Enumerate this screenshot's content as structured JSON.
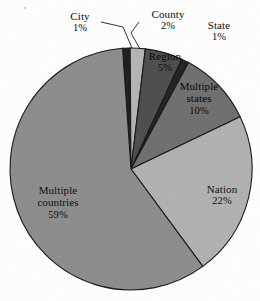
{
  "chart_data": {
    "type": "pie",
    "title": "",
    "subtitle": "",
    "xlabel": "",
    "ylabel": "",
    "grid": false,
    "legend_position": "none",
    "label_format": "name + percent",
    "total_percent": 100,
    "start_angle_deg": 356,
    "direction": "clockwise",
    "center_px": {
      "x": 131,
      "y": 169
    },
    "radius_px": 121,
    "categories": [
      "City",
      "County",
      "Region",
      "State",
      "Multiple states",
      "Nation",
      "Multiple countries"
    ],
    "values": [
      1,
      2,
      5,
      1,
      10,
      22,
      59
    ],
    "slices": [
      {
        "label": "City",
        "percent_text": "1%",
        "value": 1,
        "color": "#1b1b1b",
        "label_placement": "outside",
        "leader_line": true
      },
      {
        "label": "County",
        "percent_text": "2%",
        "value": 2,
        "color": "#b4b4b4",
        "label_placement": "outside",
        "leader_line": true
      },
      {
        "label": "Region",
        "percent_text": "5%",
        "value": 5,
        "color": "#4b4b4b",
        "label_placement": "inside",
        "leader_line": false
      },
      {
        "label": "State",
        "percent_text": "1%",
        "value": 1,
        "color": "#1f1f1f",
        "label_placement": "outside",
        "leader_line": false
      },
      {
        "label": "Multiple states",
        "percent_text": "10%",
        "value": 10,
        "color": "#6d6d6d",
        "label_placement": "inside",
        "leader_line": false
      },
      {
        "label": "Nation",
        "percent_text": "22%",
        "value": 22,
        "color": "#b0b0b0",
        "label_placement": "inside",
        "leader_line": false
      },
      {
        "label": "Multiple countries",
        "percent_text": "59%",
        "value": 59,
        "color": "#8b8b8b",
        "label_placement": "inside",
        "leader_line": false
      }
    ]
  },
  "labels": {
    "city": {
      "name": "City",
      "pct": "1%"
    },
    "county": {
      "name": "County",
      "pct": "2%"
    },
    "state": {
      "name": "State",
      "pct": "1%"
    },
    "region": {
      "name": "Region",
      "pct": "5%"
    },
    "multiple_states": {
      "name": "Multiple states",
      "pct": "10%"
    },
    "nation": {
      "name": "Nation",
      "pct": "22%"
    },
    "multiple_countries": {
      "name": "Multiple countries",
      "pct": "59%"
    }
  },
  "colors": {
    "background": "#ffffff",
    "outline": "#141414",
    "text": "#111111"
  }
}
